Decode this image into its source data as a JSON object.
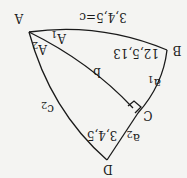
{
  "diagram": {
    "orientation": "rotated 180 degrees",
    "vertices": [
      {
        "id": "A",
        "label": "A"
      },
      {
        "id": "B",
        "label": "B"
      },
      {
        "id": "C",
        "label": "C"
      },
      {
        "id": "D",
        "label": "D"
      }
    ],
    "edges": [
      {
        "from": "A",
        "to": "B",
        "label": "3,4,5=c"
      },
      {
        "from": "B",
        "to": "C",
        "label": "a1"
      },
      {
        "from": "C",
        "to": "D",
        "label": "a2"
      },
      {
        "from": "D",
        "to": "A",
        "label": "c2"
      },
      {
        "from": "A",
        "to": "C",
        "label": "b"
      }
    ],
    "angles": [
      {
        "at": "A",
        "label": "A1"
      },
      {
        "at": "A",
        "label": "A2"
      }
    ],
    "triangle_labels": [
      {
        "triangle": "ABC",
        "label": "12,5,13"
      },
      {
        "triangle": "ACD",
        "label": "3,4,5"
      }
    ],
    "right_angle_at": "C"
  },
  "labels": {
    "A": "A",
    "B": "B",
    "C": "C",
    "D": "D",
    "c": "3,4,5=c",
    "a1_main": "a",
    "a1_sub": "1",
    "a2_main": "a",
    "a2_sub": "2",
    "c2_main": "c",
    "c2_sub": "2",
    "b": "b",
    "A1_main": "A",
    "A1_sub": "1",
    "A2_main": "A",
    "A2_sub": "2",
    "tri1": "12,5,13",
    "tri2": "3,4,5"
  }
}
